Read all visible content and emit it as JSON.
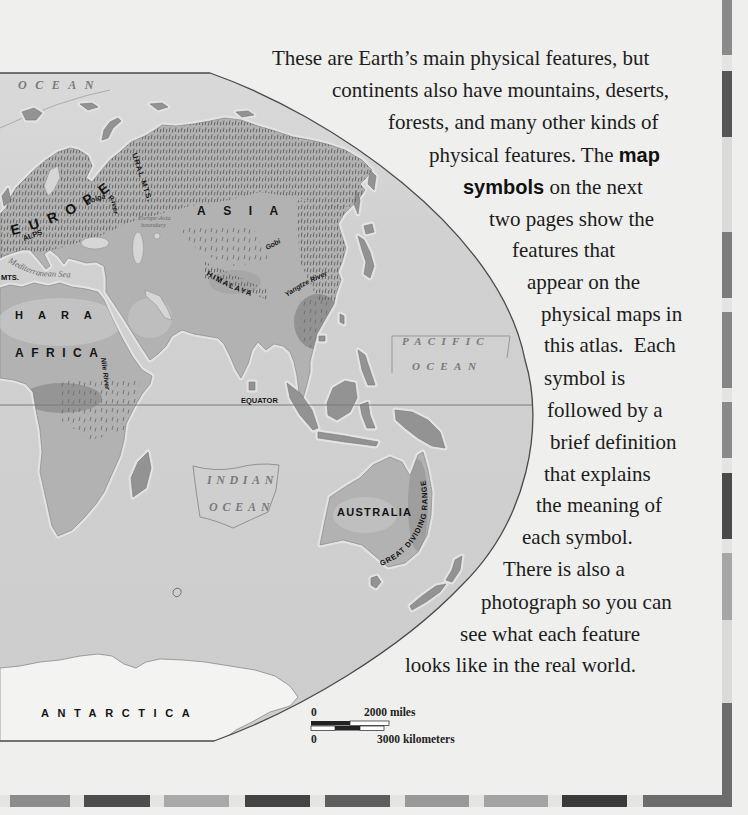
{
  "body_text": {
    "lines": [
      {
        "text": "These are Earth’s main physical features, but"
      },
      {
        "text": "continents also have mountains, deserts,"
      },
      {
        "text": "forests, and many other kinds of"
      },
      {
        "text": "physical features. The ",
        "bold": "map"
      },
      {
        "bold": "symbols",
        "text": " on the next"
      },
      {
        "text": "two pages show the"
      },
      {
        "text": "features that"
      },
      {
        "text": "appear on the"
      },
      {
        "text": "physical maps in"
      },
      {
        "text": "this atlas.  Each"
      },
      {
        "text": "symbol is"
      },
      {
        "text": "followed by a"
      },
      {
        "text": "brief definition"
      },
      {
        "text": "that explains"
      },
      {
        "text": "the meaning of"
      },
      {
        "text": "each symbol."
      },
      {
        "text": "There is also a"
      },
      {
        "text": "photograph so you can"
      },
      {
        "text": "see what each feature"
      },
      {
        "text": "looks like in the real world."
      }
    ]
  },
  "map": {
    "labels": {
      "arctic_ocean": "OCEAN",
      "europe": "EUROPE",
      "volga_river": "Volga River",
      "ural_mts": "URAL MTS.",
      "europe_asia_boundary_line1": "Europe-Asia",
      "europe_asia_boundary_line2": "boundary",
      "alps": "ALPS",
      "mediterranean_sea": "Mediterranean Sea",
      "atlas_mts": "MTS.",
      "sahara_partial": "HARA",
      "africa": "AFRICA",
      "nile_river": "Nile River",
      "asia": "ASIA",
      "gobi": "Gobi",
      "himalaya": "HIMALAYA",
      "yangtze_river": "Yangtze River",
      "pacific_ocean_line1": "PACIFIC",
      "pacific_ocean_line2": "OCEAN",
      "equator": "EQUATOR",
      "indian_ocean_line1": "INDIAN",
      "indian_ocean_line2": "OCEAN",
      "australia": "AUSTRALIA",
      "great_dividing_range": "GREAT DIVIDING RANGE",
      "antarctica": "ANTARCTICA"
    },
    "scale_bar": {
      "miles_zero": "0",
      "miles_label": "2000 miles",
      "km_zero": "0",
      "km_label": "3000 kilometers"
    }
  },
  "palette": {
    "paper": "#efefed",
    "ocean": "#cfcfcf",
    "land": "#b2b2b2",
    "antarctica": "#f3f3f1",
    "text": "#1c1c1c",
    "map_border": "#4a4a4a",
    "bar_base": "#e4e4e2",
    "right_bar": [
      "#8a8a8a",
      "#565656",
      "#dadad8",
      "#7c7c7c",
      "#858585",
      "#8a8a8a",
      "#4a4a4a",
      "#a6a6a6",
      "#dadad8",
      "#6c6c6c"
    ],
    "bottom_bar": [
      "#8c8c8c",
      "#4d4d4d",
      "#a9a9a9",
      "#444444",
      "#5e5e5e",
      "#999999",
      "#a3a3a3",
      "#3a3a3a",
      "#6c6c6c"
    ]
  }
}
